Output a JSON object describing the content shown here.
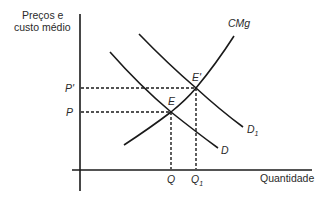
{
  "diagram": {
    "type": "economics-supply-demand",
    "y_axis_label_line1": "Preços e",
    "y_axis_label_line2": "custo médio",
    "x_axis_label": "Quantidade",
    "curves": {
      "cmg": "CMg",
      "d": "D",
      "d1": "D",
      "d1_subscript": "1"
    },
    "points": {
      "e": "E",
      "e_prime": "E'"
    },
    "price_ticks": {
      "p_prime": "P'",
      "p": "P"
    },
    "quantity_ticks": {
      "q": "Q",
      "q1": "Q",
      "q1_subscript": "1"
    },
    "colors": {
      "line": "#1a1a1a",
      "text": "#2a2a2a",
      "background": "#ffffff"
    }
  }
}
